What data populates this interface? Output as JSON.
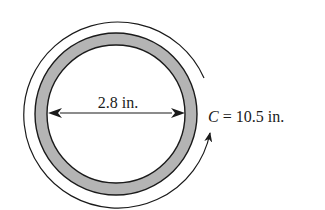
{
  "diagram": {
    "type": "circle-measurement",
    "diameter_label": "2.8 in.",
    "circumference_label_var": "C",
    "circumference_label_rest": " = 10.5 in.",
    "colors": {
      "line": "#1a1a1a",
      "ring_fill": "#b4b4b4",
      "background": "#ffffff"
    }
  }
}
